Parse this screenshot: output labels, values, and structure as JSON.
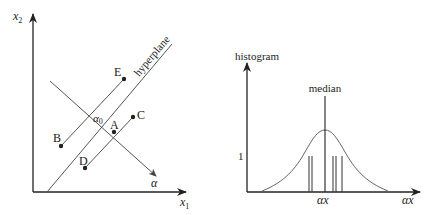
{
  "left_panel": {
    "y_axis_label": "x",
    "y_axis_sub": "2",
    "x_axis_label": "x",
    "x_axis_sub": "1",
    "hyperplane_label": "hyperplane",
    "direction_label": "α",
    "origin_label": "α",
    "origin_sub": "0",
    "points": [
      {
        "name": "A",
        "x": 114,
        "y": 132
      },
      {
        "name": "B",
        "x": 61,
        "y": 146
      },
      {
        "name": "C",
        "x": 133,
        "y": 117
      },
      {
        "name": "D",
        "x": 85,
        "y": 168
      },
      {
        "name": "E",
        "x": 124,
        "y": 79
      }
    ]
  },
  "right_panel": {
    "y_axis_label": "histogram",
    "x_axis_label": "αx",
    "median_label": "median",
    "tick_y_label": "1",
    "tick_x_label": "αx"
  },
  "colors": {
    "line": "#555555",
    "axis": "#222222",
    "text": "#222222"
  }
}
